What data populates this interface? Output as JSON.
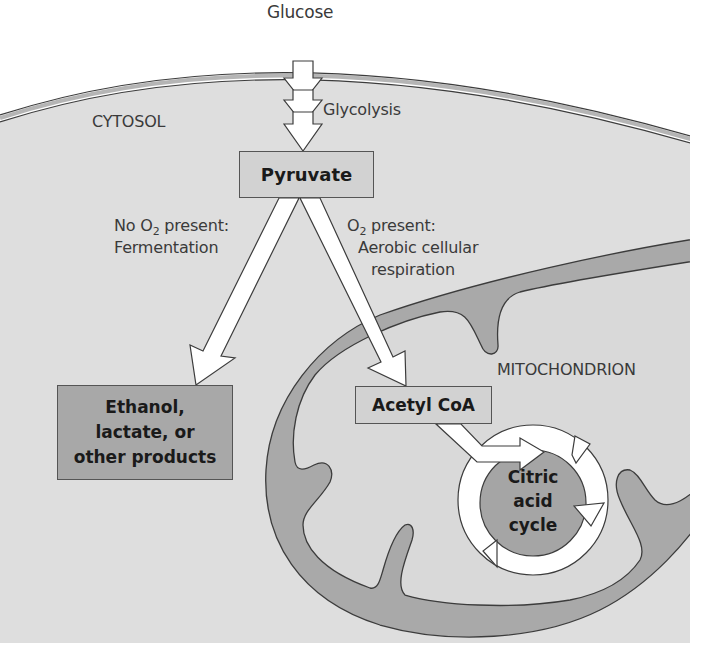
{
  "colors": {
    "cytosol": "#dedede",
    "membrane_fill": "#b5b5b5",
    "mito_membrane": "#a9a9a9",
    "mito_matrix": "#d9d9d9",
    "box_light": "#d2d2d2",
    "box_dark": "#a8a8a8",
    "cycle_core": "#a5a5a5",
    "arrow_fill": "#ffffff",
    "outline": "#3c3c3c",
    "text": "#3a3a3a"
  },
  "labels": {
    "glucose": "Glucose",
    "glycolysis": "Glycolysis",
    "cytosol": "CYTOSOL",
    "mitochondrion": "MITOCHONDRION",
    "no_o2_line1_pre": "No O",
    "no_o2_sub": "2",
    "no_o2_line1_post": " present:",
    "no_o2_line2": "Fermentation",
    "o2_line1_pre": "O",
    "o2_sub": "2",
    "o2_line1_post": " present:",
    "o2_line2": "Aerobic cellular",
    "o2_line3": "respiration"
  },
  "boxes": {
    "pyruvate": "Pyruvate",
    "fermentation_products": [
      "Ethanol,",
      "lactate, or",
      "other products"
    ],
    "acetyl_coa": "Acetyl CoA",
    "citric_acid_cycle": [
      "Citric",
      "acid",
      "cycle"
    ]
  }
}
